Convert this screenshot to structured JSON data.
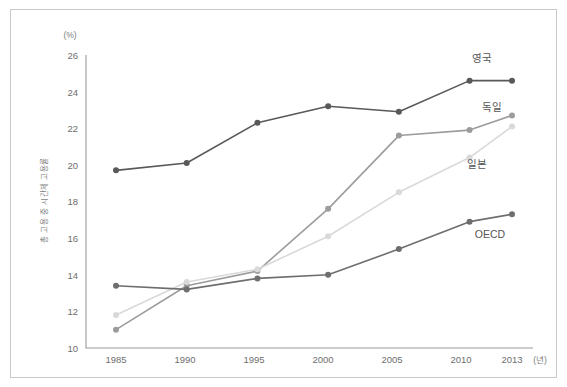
{
  "figure": {
    "y_axis_unit": "(%)",
    "x_axis_unit": "(년)",
    "y_axis_title": "총 고용 중 시간제 고용률"
  },
  "chart_data": {
    "type": "line",
    "title": "",
    "subtitle": "",
    "xlabel": "(년)",
    "ylabel": "총 고용 중 시간제 고용률",
    "yunit": "(%)",
    "categories": [
      "1985",
      "1990",
      "1995",
      "2000",
      "2005",
      "2010",
      "2013"
    ],
    "x": [
      1985,
      1990,
      1995,
      2000,
      2005,
      2010,
      2013
    ],
    "ylim": [
      10,
      26
    ],
    "yticks": [
      10,
      12,
      14,
      16,
      18,
      20,
      22,
      24,
      26
    ],
    "ytick_labels": [
      "10",
      "12",
      "14",
      "16",
      "18",
      "20",
      "22",
      "24",
      "26"
    ],
    "grid": false,
    "legend_position": "right-inline",
    "series": [
      {
        "name": "영국",
        "label": "영국",
        "color": "#595959",
        "values": [
          19.7,
          20.1,
          22.3,
          23.2,
          22.9,
          24.6,
          24.6
        ]
      },
      {
        "name": "독일",
        "label": "독일",
        "color": "#9c9c9c",
        "values": [
          11.0,
          13.4,
          14.2,
          17.6,
          21.6,
          21.9,
          22.7
        ]
      },
      {
        "name": "일본",
        "label": "일본",
        "color": "#d9d9d9",
        "values": [
          11.8,
          13.6,
          14.3,
          16.1,
          18.5,
          20.4,
          22.1
        ]
      },
      {
        "name": "OECD",
        "label": "OECD",
        "color": "#6e6e6e",
        "values": [
          13.4,
          13.2,
          13.8,
          14.0,
          15.4,
          16.9,
          17.3
        ]
      }
    ]
  },
  "series_labels": {
    "uk": "영국",
    "germany": "독일",
    "japan": "일본",
    "oecd": "OECD"
  },
  "axis": {
    "y_ticks": [
      "26",
      "24",
      "22",
      "20",
      "18",
      "16",
      "14",
      "12",
      "10"
    ],
    "x_ticks": [
      "1985",
      "1990",
      "1995",
      "2000",
      "2005",
      "2010",
      "2013"
    ]
  }
}
